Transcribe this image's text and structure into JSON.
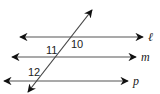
{
  "diagram": {
    "type": "parallel lines cut by a transversal",
    "lines": [
      {
        "name": "l",
        "label": "ℓ",
        "y": 37,
        "x1": 20,
        "x2": 143
      },
      {
        "name": "m",
        "label": "m",
        "y": 57,
        "x1": 12,
        "x2": 136
      },
      {
        "name": "p",
        "label": "p",
        "y": 81,
        "x1": 4,
        "x2": 128
      }
    ],
    "transversal": {
      "x1": 92,
      "y1": 10,
      "x2": 28,
      "y2": 92
    },
    "angles": [
      {
        "label": "10",
        "x": 72,
        "y": 47
      },
      {
        "label": "11",
        "x": 46,
        "y": 53
      },
      {
        "label": "12",
        "x": 28,
        "y": 75
      }
    ],
    "colors": {
      "line": "#555555",
      "arrow": "#111111",
      "text": "#222222"
    }
  }
}
